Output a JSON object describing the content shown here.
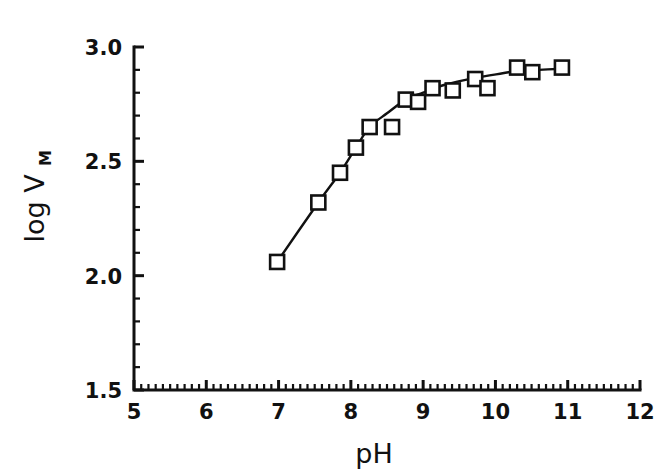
{
  "chart_data": {
    "type": "scatter",
    "title": "",
    "subtitle": "",
    "xlabel": "pH",
    "ylabel": "log V",
    "ylabel_subscript": "M",
    "ylabel_full": "log V_M",
    "xlim": [
      5,
      12
    ],
    "ylim": [
      1.5,
      3.0
    ],
    "x_ticks": [
      5,
      6,
      7,
      8,
      9,
      10,
      11,
      12
    ],
    "x_tick_labels": [
      "5",
      "6",
      "7",
      "8",
      "9",
      "10",
      "11",
      "12"
    ],
    "y_ticks": [
      1.5,
      2.0,
      2.5,
      3.0
    ],
    "y_tick_labels": [
      "1.5",
      "2.0",
      "2.5",
      "3.0"
    ],
    "x_minor_tick_step": 0.1,
    "y_minor_tick_step": 0.1,
    "grid": false,
    "legend": null,
    "marker_style": "open-square",
    "line_style": "solid",
    "series": [
      {
        "name": "log Vm vs pH",
        "color": "#111111",
        "x": [
          6.98,
          7.55,
          7.85,
          8.07,
          8.26,
          8.57,
          8.76,
          8.93,
          9.13,
          9.41,
          9.72,
          9.89,
          10.3,
          10.51,
          10.92
        ],
        "y": [
          2.06,
          2.32,
          2.45,
          2.56,
          2.65,
          2.65,
          2.77,
          2.76,
          2.82,
          2.81,
          2.86,
          2.82,
          2.91,
          2.89,
          2.91
        ]
      }
    ],
    "fit_curve": {
      "description": "smooth sigmoidal curve through points",
      "x": [
        6.98,
        7.55,
        7.85,
        8.07,
        8.26,
        8.5,
        8.76,
        9.0,
        9.3,
        9.72,
        10.1,
        10.3,
        10.6,
        10.92
      ],
      "y": [
        2.06,
        2.32,
        2.45,
        2.56,
        2.65,
        2.71,
        2.77,
        2.8,
        2.835,
        2.865,
        2.885,
        2.895,
        2.9,
        2.905
      ]
    }
  },
  "colors": {
    "ink": "#111111",
    "background": "#ffffff"
  }
}
